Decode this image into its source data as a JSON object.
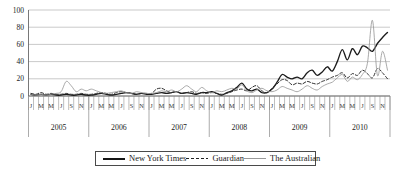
{
  "figure": {
    "legend": [
      {
        "label": "New York Times",
        "style": "solid-bold"
      },
      {
        "label": "Guardian",
        "style": "dashed"
      },
      {
        "label": "The Australian",
        "style": "solid-thin"
      }
    ]
  },
  "chart_data": {
    "type": "line",
    "title": "",
    "xlabel": "",
    "ylabel": "",
    "x_unit": "month",
    "years": [
      2005,
      2006,
      2007,
      2008,
      2009,
      2010
    ],
    "month_tick_letters": [
      "J",
      "M",
      "M",
      "J",
      "S",
      "N"
    ],
    "ylim": [
      0,
      100
    ],
    "yticks": [
      0,
      20,
      40,
      60,
      80,
      100
    ],
    "grid": "horizontal",
    "legend_position": "bottom",
    "colors": {
      "axis": "#555555",
      "gridline": "#b3b3b3",
      "tick": "#888888",
      "text": "#222222"
    },
    "series": [
      {
        "name": "New York Times",
        "style": "solid-bold",
        "color": "#1c1c1c",
        "values": [
          2,
          1,
          2,
          1,
          2,
          1,
          1,
          2,
          1,
          1,
          2,
          1,
          1,
          2,
          3,
          2,
          1,
          2,
          3,
          4,
          3,
          2,
          3,
          2,
          2,
          3,
          4,
          3,
          4,
          5,
          3,
          4,
          3,
          2,
          4,
          4,
          5,
          3,
          1,
          4,
          6,
          10,
          15,
          8,
          6,
          8,
          4,
          4,
          8,
          16,
          25,
          22,
          20,
          22,
          20,
          27,
          30,
          24,
          28,
          34,
          29,
          40,
          54,
          42,
          55,
          48,
          58,
          56,
          52,
          61,
          68,
          74
        ]
      },
      {
        "name": "Guardian",
        "style": "dashed",
        "color": "#2e2e2e",
        "values": [
          3,
          2,
          4,
          2,
          3,
          2,
          2,
          3,
          2,
          2,
          3,
          2,
          2,
          3,
          4,
          3,
          2,
          4,
          5,
          4,
          3,
          2,
          3,
          3,
          3,
          8,
          9,
          6,
          4,
          5,
          3,
          4,
          5,
          3,
          4,
          3,
          4,
          3,
          2,
          3,
          5,
          7,
          8,
          6,
          10,
          12,
          6,
          4,
          9,
          14,
          19,
          18,
          13,
          15,
          14,
          17,
          15,
          14,
          17,
          19,
          22,
          24,
          27,
          21,
          26,
          24,
          30,
          26,
          21,
          32,
          27,
          20
        ]
      },
      {
        "name": "The Australian",
        "style": "solid-thin",
        "color": "#999999",
        "values": [
          2,
          1,
          2,
          1,
          2,
          3,
          5,
          17,
          12,
          5,
          8,
          6,
          8,
          6,
          4,
          3,
          4,
          5,
          6,
          4,
          3,
          5,
          4,
          3,
          3,
          4,
          6,
          5,
          7,
          5,
          8,
          12,
          8,
          5,
          10,
          6,
          4,
          6,
          5,
          7,
          9,
          8,
          13,
          6,
          4,
          7,
          9,
          6,
          5,
          7,
          11,
          9,
          7,
          5,
          8,
          12,
          9,
          7,
          11,
          14,
          16,
          21,
          25,
          17,
          22,
          19,
          25,
          38,
          88,
          24,
          52,
          30
        ]
      }
    ]
  }
}
